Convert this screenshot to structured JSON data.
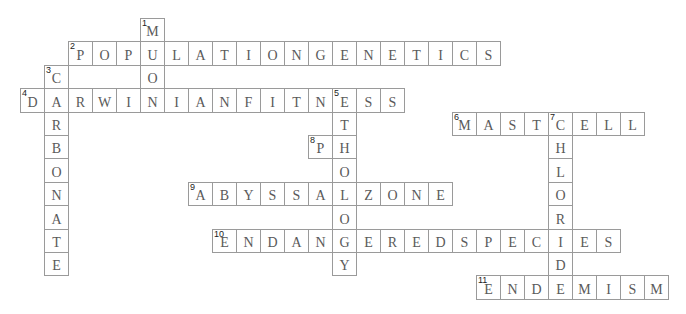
{
  "puzzle": {
    "cell_width": 24,
    "cell_height": 23.4,
    "origin_x": 20,
    "origin_y": 18,
    "colors": {
      "border": "#9a9a9a",
      "letter": "#5a5a5a",
      "number": "#222222",
      "background": "#ffffff"
    }
  },
  "words": [
    {
      "number": 1,
      "direction": "down",
      "answer": "MUON",
      "row": 0,
      "col": 5
    },
    {
      "number": 2,
      "direction": "across",
      "answer": "POPULATIONGENETICS",
      "row": 1,
      "col": 2
    },
    {
      "number": 3,
      "direction": "down",
      "answer": "CARBONATE",
      "row": 2,
      "col": 1
    },
    {
      "number": 4,
      "direction": "across",
      "answer": "DARWINIANFITNESS",
      "row": 3,
      "col": 0
    },
    {
      "number": 5,
      "direction": "down",
      "answer": "ETHOLOGY",
      "row": 3,
      "col": 13
    },
    {
      "number": 6,
      "direction": "across",
      "answer": "MASTCELL",
      "row": 4,
      "col": 18
    },
    {
      "number": 7,
      "direction": "down",
      "answer": "CHLORIDE",
      "row": 4,
      "col": 22
    },
    {
      "number": 8,
      "direction": "across",
      "answer": "PH",
      "row": 5,
      "col": 12
    },
    {
      "number": 9,
      "direction": "across",
      "answer": "ABYSSALZONE",
      "row": 7,
      "col": 7
    },
    {
      "number": 10,
      "direction": "across",
      "answer": "ENDANGEREDSPECIES",
      "row": 9,
      "col": 8
    },
    {
      "number": 11,
      "direction": "across",
      "answer": "ENDEMISM",
      "row": 11,
      "col": 19
    }
  ]
}
